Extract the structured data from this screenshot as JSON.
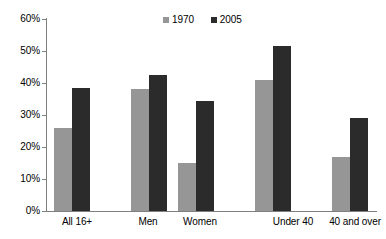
{
  "chart_data": {
    "type": "bar",
    "title": "",
    "subtitle": "",
    "xlabel": "",
    "ylabel": "",
    "ylim": [
      0,
      60
    ],
    "ytick_values": [
      0,
      10,
      20,
      30,
      40,
      50,
      60
    ],
    "ytick_labels": [
      "0%",
      "10%",
      "20%",
      "30%",
      "40%",
      "50%",
      "60%"
    ],
    "grid": false,
    "legend_position": "top-center",
    "categories": [
      "All 16+",
      "Men",
      "Women",
      "Under 40",
      "40 and over"
    ],
    "series": [
      {
        "name": "1970",
        "color": "#969696",
        "values": [
          26,
          38,
          15,
          41,
          17
        ]
      },
      {
        "name": "2005",
        "color": "#2b2b2b",
        "values": [
          38.5,
          42.5,
          34.5,
          51.5,
          29
        ]
      }
    ]
  },
  "legend": {
    "entries": [
      {
        "label": "1970",
        "color": "#969696",
        "marker": "square-marker"
      },
      {
        "label": "2005",
        "color": "#2b2b2b",
        "marker": "square-marker"
      }
    ]
  },
  "axis": {
    "y_labels": [
      "60%",
      "50%",
      "40%",
      "30%",
      "20%",
      "10%",
      "0%"
    ],
    "x_labels": [
      "All 16+",
      "Men",
      "Women",
      "Under 40",
      "40 and over"
    ]
  }
}
